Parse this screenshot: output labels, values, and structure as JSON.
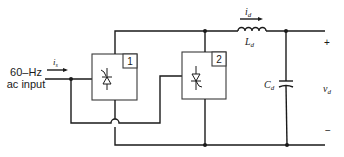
{
  "diagram": {
    "type": "circuit-schematic",
    "input": {
      "label_line1": "60–Hz",
      "label_line2": "ac input",
      "current_label": "i",
      "current_subscript": "s"
    },
    "converters": [
      {
        "id": "converter-1",
        "number_label": "1"
      },
      {
        "id": "converter-2",
        "number_label": "2"
      }
    ],
    "inductor": {
      "label": "L",
      "label_subscript": "d",
      "current_label": "i",
      "current_subscript": "d"
    },
    "capacitor": {
      "label": "C",
      "label_subscript": "d"
    },
    "output": {
      "plus": "+",
      "minus": "−",
      "voltage_label": "v",
      "voltage_subscript": "d"
    },
    "colors": {
      "line": "#1a1a1a",
      "box": "#3a3a3a",
      "background": "#ffffff"
    }
  }
}
